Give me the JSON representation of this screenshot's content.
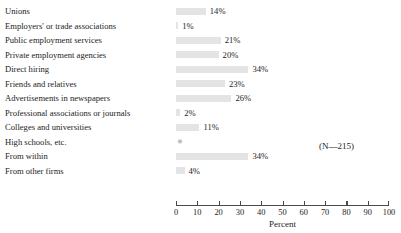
{
  "chart_data": {
    "type": "bar",
    "orientation": "horizontal",
    "title": "",
    "xlabel": "Percent",
    "ylabel": "",
    "xlim": [
      0,
      100
    ],
    "grid": false,
    "legend": null,
    "annotation": "(N—215)",
    "categories": [
      "Unions",
      "Employers' or trade associations",
      "Public employment services",
      "Private employment agencies",
      "Direct hiring",
      "Friends and relatives",
      "Advertisements in newspapers",
      "Professional associations or journals",
      "Colleges and universities",
      "High schools, etc.",
      "From within",
      "From other firms"
    ],
    "values": [
      14,
      1,
      21,
      20,
      34,
      23,
      26,
      2,
      11,
      0,
      34,
      4
    ],
    "value_labels": [
      "14%",
      "1%",
      "21%",
      "20%",
      "34%",
      "23%",
      "26%",
      "2%",
      "11%",
      "",
      "34%",
      "4%"
    ],
    "ticks": [
      0,
      10,
      20,
      30,
      40,
      50,
      60,
      70,
      80,
      90,
      100
    ],
    "tick_labels": [
      "0",
      "10",
      "20",
      "30",
      "40",
      "50",
      "60",
      "70",
      "80",
      "90",
      "100"
    ],
    "bar_color": "#e4e4e4",
    "axis_color": "#4b4b4b",
    "text_color": "#1d1d1d",
    "marker_rows": [
      9
    ],
    "marker_glyph": "✵"
  }
}
